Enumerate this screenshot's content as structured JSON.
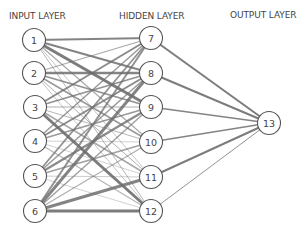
{
  "labels": {
    "input": "INPUT LAYER",
    "hidden": "HIDDEN LAYER",
    "output": "OUTPUT LAYER"
  },
  "style": {
    "edge_color": "#6e6e6e",
    "node_stroke": "#555555",
    "node_fill": "#ffffff",
    "text_color": "#444444",
    "node_radius": 11.5
  },
  "nodes": [
    {
      "id": 1,
      "label": "1",
      "layer": "input",
      "x": 34,
      "y": 40
    },
    {
      "id": 2,
      "label": "2",
      "layer": "input",
      "x": 34,
      "y": 73
    },
    {
      "id": 3,
      "label": "3",
      "layer": "input",
      "x": 35,
      "y": 107
    },
    {
      "id": 4,
      "label": "4",
      "layer": "input",
      "x": 35,
      "y": 141
    },
    {
      "id": 5,
      "label": "5",
      "layer": "input",
      "x": 35,
      "y": 176
    },
    {
      "id": 6,
      "label": "6",
      "layer": "input",
      "x": 35,
      "y": 211
    },
    {
      "id": 7,
      "label": "7",
      "layer": "hidden",
      "x": 151,
      "y": 38
    },
    {
      "id": 8,
      "label": "8",
      "layer": "hidden",
      "x": 151,
      "y": 73
    },
    {
      "id": 9,
      "label": "9",
      "layer": "hidden",
      "x": 151,
      "y": 107
    },
    {
      "id": 10,
      "label": "10",
      "layer": "hidden",
      "x": 151,
      "y": 142
    },
    {
      "id": 11,
      "label": "11",
      "layer": "hidden",
      "x": 151,
      "y": 177
    },
    {
      "id": 12,
      "label": "12",
      "layer": "hidden",
      "x": 151,
      "y": 211
    },
    {
      "id": 13,
      "label": "13",
      "layer": "output",
      "x": 269,
      "y": 123
    }
  ],
  "edges": [
    {
      "from": 1,
      "to": 7,
      "w": 2.0,
      "o": 0.85
    },
    {
      "from": 1,
      "to": 8,
      "w": 2.2,
      "o": 0.85
    },
    {
      "from": 1,
      "to": 9,
      "w": 3.0,
      "o": 0.9
    },
    {
      "from": 1,
      "to": 10,
      "w": 1.2,
      "o": 0.6
    },
    {
      "from": 1,
      "to": 11,
      "w": 0.8,
      "o": 0.5
    },
    {
      "from": 1,
      "to": 12,
      "w": 1.0,
      "o": 0.5
    },
    {
      "from": 2,
      "to": 7,
      "w": 1.2,
      "o": 0.6
    },
    {
      "from": 2,
      "to": 8,
      "w": 2.5,
      "o": 0.85
    },
    {
      "from": 2,
      "to": 9,
      "w": 1.8,
      "o": 0.75
    },
    {
      "from": 2,
      "to": 10,
      "w": 1.5,
      "o": 0.7
    },
    {
      "from": 2,
      "to": 11,
      "w": 1.0,
      "o": 0.55
    },
    {
      "from": 2,
      "to": 12,
      "w": 0.8,
      "o": 0.5
    },
    {
      "from": 3,
      "to": 7,
      "w": 2.0,
      "o": 0.8
    },
    {
      "from": 3,
      "to": 8,
      "w": 1.8,
      "o": 0.75
    },
    {
      "from": 3,
      "to": 9,
      "w": 1.2,
      "o": 0.55
    },
    {
      "from": 3,
      "to": 10,
      "w": 1.0,
      "o": 0.5
    },
    {
      "from": 3,
      "to": 11,
      "w": 1.5,
      "o": 0.6
    },
    {
      "from": 3,
      "to": 12,
      "w": 3.0,
      "o": 0.9
    },
    {
      "from": 4,
      "to": 7,
      "w": 1.5,
      "o": 0.7
    },
    {
      "from": 4,
      "to": 8,
      "w": 2.0,
      "o": 0.8
    },
    {
      "from": 4,
      "to": 9,
      "w": 1.5,
      "o": 0.7
    },
    {
      "from": 4,
      "to": 10,
      "w": 0.8,
      "o": 0.4
    },
    {
      "from": 4,
      "to": 11,
      "w": 0.8,
      "o": 0.4
    },
    {
      "from": 4,
      "to": 12,
      "w": 1.2,
      "o": 0.5
    },
    {
      "from": 5,
      "to": 7,
      "w": 1.8,
      "o": 0.75
    },
    {
      "from": 5,
      "to": 8,
      "w": 1.5,
      "o": 0.7
    },
    {
      "from": 5,
      "to": 9,
      "w": 2.2,
      "o": 0.8
    },
    {
      "from": 5,
      "to": 10,
      "w": 1.5,
      "o": 0.65
    },
    {
      "from": 5,
      "to": 11,
      "w": 1.0,
      "o": 0.35
    },
    {
      "from": 5,
      "to": 12,
      "w": 0.8,
      "o": 0.4
    },
    {
      "from": 6,
      "to": 7,
      "w": 2.0,
      "o": 0.75
    },
    {
      "from": 6,
      "to": 8,
      "w": 3.0,
      "o": 0.85
    },
    {
      "from": 6,
      "to": 9,
      "w": 1.5,
      "o": 0.65
    },
    {
      "from": 6,
      "to": 10,
      "w": 1.2,
      "o": 0.55
    },
    {
      "from": 6,
      "to": 11,
      "w": 3.0,
      "o": 0.85
    },
    {
      "from": 6,
      "to": 12,
      "w": 2.8,
      "o": 0.9
    },
    {
      "from": 7,
      "to": 13,
      "w": 2.0,
      "o": 0.9
    },
    {
      "from": 8,
      "to": 13,
      "w": 2.0,
      "o": 0.9
    },
    {
      "from": 9,
      "to": 13,
      "w": 1.5,
      "o": 0.85
    },
    {
      "from": 10,
      "to": 13,
      "w": 1.6,
      "o": 0.85
    },
    {
      "from": 11,
      "to": 13,
      "w": 2.0,
      "o": 0.9
    },
    {
      "from": 12,
      "to": 13,
      "w": 1.0,
      "o": 0.75
    }
  ]
}
